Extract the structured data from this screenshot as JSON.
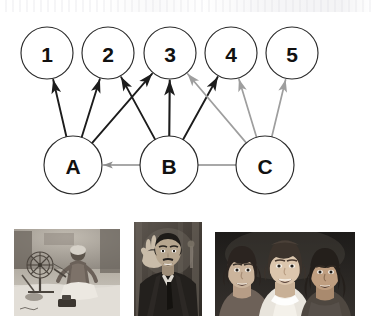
{
  "diagram": {
    "title": "",
    "top_nodes": [
      {
        "id": "1",
        "label": "1",
        "cx": 47,
        "cy": 53,
        "r": 26
      },
      {
        "id": "2",
        "label": "2",
        "cx": 108,
        "cy": 53,
        "r": 26
      },
      {
        "id": "3",
        "label": "3",
        "cx": 170,
        "cy": 53,
        "r": 26
      },
      {
        "id": "4",
        "label": "4",
        "cx": 231,
        "cy": 53,
        "r": 26
      },
      {
        "id": "5",
        "label": "5",
        "cx": 292,
        "cy": 53,
        "r": 26
      }
    ],
    "bottom_nodes": [
      {
        "id": "A",
        "label": "A",
        "cx": 73,
        "cy": 165,
        "r": 29
      },
      {
        "id": "B",
        "label": "B",
        "cx": 169,
        "cy": 165,
        "r": 29
      },
      {
        "id": "C",
        "label": "C",
        "cx": 265,
        "cy": 165,
        "r": 29
      }
    ],
    "edges": [
      {
        "from": "A",
        "to": "1",
        "color": "#1c1c1c",
        "weight": 1.9
      },
      {
        "from": "A",
        "to": "2",
        "color": "#1c1c1c",
        "weight": 1.9
      },
      {
        "from": "A",
        "to": "3",
        "color": "#1c1c1c",
        "weight": 1.9
      },
      {
        "from": "B",
        "to": "2",
        "color": "#1c1c1c",
        "weight": 1.9
      },
      {
        "from": "B",
        "to": "3",
        "color": "#1c1c1c",
        "weight": 2.1
      },
      {
        "from": "B",
        "to": "4",
        "color": "#1c1c1c",
        "weight": 1.9
      },
      {
        "from": "C",
        "to": "3",
        "color": "#9e9e9e",
        "weight": 1.7
      },
      {
        "from": "C",
        "to": "4",
        "color": "#9e9e9e",
        "weight": 1.7
      },
      {
        "from": "C",
        "to": "5",
        "color": "#9e9e9e",
        "weight": 1.7
      },
      {
        "from": "C",
        "to": "A",
        "color": "#8c8c8c",
        "weight": 1.3
      }
    ],
    "colors": {
      "node_stroke": "#2b2b2b",
      "node_fill": "#ffffff",
      "label": "#111111",
      "edge_dark": "#1c1c1c",
      "edge_light": "#9e9e9e",
      "background": "#ffffff"
    }
  },
  "photos": [
    {
      "name": "gandhi-spinning-wheel-photo",
      "caption": "",
      "x": 14,
      "y": 14,
      "w": 106,
      "h": 87,
      "tone": "sepia-grayscale"
    },
    {
      "name": "martin-luther-king-speaking-photo",
      "caption": "",
      "x": 134,
      "y": 7,
      "w": 68,
      "h": 94,
      "tone": "grayscale"
    },
    {
      "name": "three-women-portrait-photo",
      "caption": "",
      "x": 215,
      "y": 17,
      "w": 140,
      "h": 84,
      "tone": "grayscale"
    }
  ]
}
